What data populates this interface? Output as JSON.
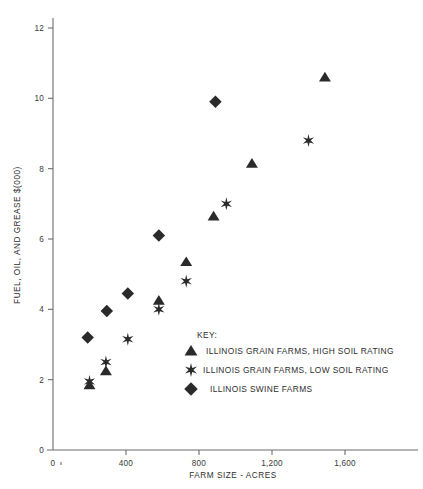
{
  "chart_data": {
    "type": "scatter",
    "title": "",
    "xlabel": "FARM SIZE - ACRES",
    "ylabel": "FUEL, OIL, AND GREASE $(000)",
    "xlim": [
      0,
      1800
    ],
    "ylim": [
      0,
      12.6
    ],
    "grid": false,
    "legend_position": "inside-center",
    "legend_title": "KEY:",
    "xticks": [
      0,
      400,
      800,
      1200,
      1600
    ],
    "xticklabels": [
      "0",
      "400",
      "800",
      "1,200",
      "1,600"
    ],
    "yticks": [
      0,
      2,
      4,
      6,
      8,
      10,
      12
    ],
    "yticklabels": [
      "0",
      "2",
      "4",
      "6",
      "8",
      "10",
      "12"
    ],
    "series": [
      {
        "name": "ILLINOIS GRAIN FARMS, HIGH SOIL RATING",
        "marker": "triangle",
        "color": "#2a2a2a",
        "points": [
          {
            "x": 200,
            "y": 1.85
          },
          {
            "x": 290,
            "y": 2.25
          },
          {
            "x": 580,
            "y": 4.25
          },
          {
            "x": 730,
            "y": 5.35
          },
          {
            "x": 880,
            "y": 6.65
          },
          {
            "x": 1090,
            "y": 8.15
          },
          {
            "x": 1490,
            "y": 10.6
          }
        ]
      },
      {
        "name": "ILLINOIS GRAIN FARMS, LOW SOIL RATING",
        "marker": "asterisk",
        "color": "#2a2a2a",
        "points": [
          {
            "x": 200,
            "y": 1.95
          },
          {
            "x": 290,
            "y": 2.5
          },
          {
            "x": 410,
            "y": 3.15
          },
          {
            "x": 580,
            "y": 4.0
          },
          {
            "x": 730,
            "y": 4.8
          },
          {
            "x": 950,
            "y": 7.0
          },
          {
            "x": 1400,
            "y": 8.8
          }
        ]
      },
      {
        "name": "ILLINOIS SWINE FARMS",
        "marker": "diamond",
        "color": "#2a2a2a",
        "points": [
          {
            "x": 190,
            "y": 3.2
          },
          {
            "x": 295,
            "y": 3.95
          },
          {
            "x": 410,
            "y": 4.45
          },
          {
            "x": 580,
            "y": 6.1
          },
          {
            "x": 890,
            "y": 9.9
          }
        ]
      }
    ]
  },
  "legend": {
    "title": "KEY:",
    "entries": [
      {
        "marker": "triangle",
        "label": "ILLINOIS GRAIN FARMS, HIGH SOIL RATING"
      },
      {
        "marker": "asterisk",
        "label": "ILLINOIS GRAIN FARMS, LOW SOIL RATING"
      },
      {
        "marker": "diamond",
        "label": "ILLINOIS SWINE FARMS"
      }
    ]
  },
  "axes": {
    "x_title": "FARM SIZE - ACRES",
    "y_title": "FUEL, OIL, AND GREASE $(000)"
  }
}
